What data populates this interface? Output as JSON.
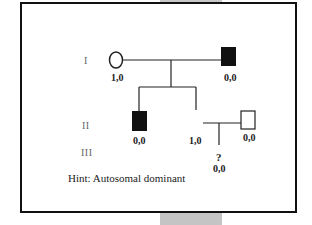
{
  "diagram": {
    "type": "pedigree",
    "generations": [
      {
        "label": "I"
      },
      {
        "label": "II"
      },
      {
        "label": "III"
      }
    ],
    "individuals": [
      {
        "id": "I-1",
        "sex": "female",
        "affected": false,
        "genotype": "1,0"
      },
      {
        "id": "I-2",
        "sex": "male",
        "affected": true,
        "genotype": "0,0"
      },
      {
        "id": "II-1",
        "sex": "male",
        "affected": true,
        "genotype": "0,0"
      },
      {
        "id": "II-2",
        "sex": "unknown",
        "affected": false,
        "genotype": "1,0"
      },
      {
        "id": "II-3",
        "sex": "male",
        "affected": false,
        "genotype": "0,0"
      },
      {
        "id": "III-1",
        "sex": "unknown",
        "affected": null,
        "marker": "?",
        "genotype": "0,0"
      }
    ],
    "hint": "Hint: Autosomal dominant",
    "colors": {
      "affected": "#111111",
      "line": "#222222",
      "frame": "#111111"
    }
  }
}
